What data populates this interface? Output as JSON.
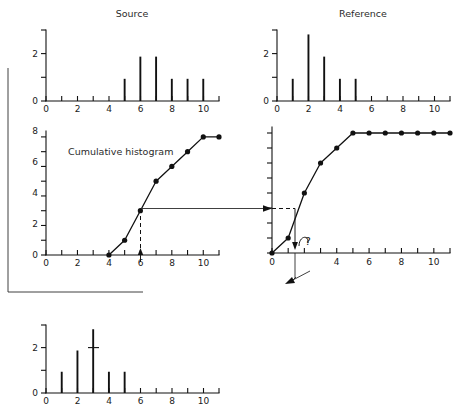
{
  "figure": {
    "background": "#ffffff",
    "ink_color": "#111111",
    "caption_color": "#2b2b2b"
  },
  "panels": {
    "source": {
      "title": "Source",
      "x_ticks": [
        "0",
        "2",
        "4",
        "6",
        "8",
        "10"
      ],
      "y_ticks": [
        "0",
        "2"
      ]
    },
    "reference": {
      "title": "Reference",
      "x_ticks": [
        "0",
        "2",
        "4",
        "6",
        "8",
        "10"
      ],
      "y_ticks": [
        "0",
        "2"
      ]
    },
    "cumulative_source": {
      "title": "Cumulative histogram",
      "x_ticks": [
        "0",
        "2",
        "4",
        "6",
        "8",
        "10"
      ],
      "y_ticks": [
        "0",
        "2",
        "4",
        "6",
        "8"
      ]
    },
    "cumulative_reference": {
      "title": "",
      "x_ticks": [
        "0",
        "4",
        "6",
        "8",
        "10"
      ],
      "y_ticks": []
    },
    "result": {
      "title": "",
      "x_ticks": [
        "0",
        "2",
        "4",
        "6",
        "8",
        "10"
      ],
      "y_ticks": [
        "0",
        "2"
      ]
    }
  },
  "annotations": {
    "question_mark": "?",
    "lookup_value_label": "3",
    "mapped_value_label": "1"
  },
  "chart_data": [
    {
      "id": "source-histogram",
      "type": "bar",
      "title": "Source",
      "xlabel": "",
      "ylabel": "",
      "categories": [
        0,
        1,
        2,
        3,
        4,
        5,
        6,
        7,
        8,
        9,
        10,
        11
      ],
      "values": [
        0,
        0,
        0,
        0,
        0,
        1,
        2,
        2,
        1,
        1,
        1,
        0
      ],
      "xlim": [
        0,
        11
      ],
      "ylim": [
        0,
        3.2
      ],
      "xticks": [
        0,
        1,
        2,
        3,
        4,
        5,
        6,
        7,
        8,
        9,
        10,
        11
      ],
      "xticklabels": {
        "0": "0",
        "2": "2",
        "4": "4",
        "6": "6",
        "8": "8",
        "10": "10"
      },
      "yticks": [
        0,
        1,
        2,
        3
      ],
      "yticklabels": {
        "0": "0",
        "2": "2"
      },
      "grid": false,
      "legend": null
    },
    {
      "id": "reference-histogram",
      "type": "bar",
      "title": "Reference",
      "xlabel": "",
      "ylabel": "",
      "categories": [
        0,
        1,
        2,
        3,
        4,
        5,
        6,
        7,
        8,
        9,
        10,
        11
      ],
      "values": [
        0,
        1,
        3,
        2,
        1,
        1,
        0,
        0,
        0,
        0,
        0,
        0
      ],
      "xlim": [
        0,
        11
      ],
      "ylim": [
        0,
        3.2
      ],
      "xticks": [
        0,
        1,
        2,
        3,
        4,
        5,
        6,
        7,
        8,
        9,
        10,
        11
      ],
      "xticklabels": {
        "0": "0",
        "2": "2",
        "4": "4",
        "6": "6",
        "8": "8",
        "10": "10"
      },
      "yticks": [
        0,
        1,
        2,
        3
      ],
      "yticklabels": {
        "0": "0",
        "2": "2"
      },
      "grid": false,
      "legend": null
    },
    {
      "id": "cumulative-source",
      "type": "line",
      "title": "Cumulative histogram",
      "xlabel": "",
      "ylabel": "",
      "x": [
        4,
        5,
        6,
        7,
        8,
        9,
        10,
        11
      ],
      "y": [
        0,
        1,
        3,
        5,
        6,
        7,
        8,
        8
      ],
      "markers": true,
      "xlim": [
        0,
        11
      ],
      "ylim": [
        0,
        8.4
      ],
      "xticks": [
        0,
        1,
        2,
        3,
        4,
        5,
        6,
        7,
        8,
        9,
        10,
        11
      ],
      "xticklabels": {
        "0": "0",
        "2": "2",
        "4": "4",
        "6": "6",
        "8": "8",
        "10": "10"
      },
      "yticks": [
        0,
        1,
        2,
        3,
        4,
        5,
        6,
        7,
        8
      ],
      "yticklabels": {
        "0": "0",
        "2": "2",
        "4": "4",
        "6": "6",
        "8": "8"
      },
      "grid": false,
      "legend": null,
      "annotations": [
        {
          "kind": "dashed-vertical",
          "x": 6,
          "y_from": 0,
          "y_to": 3
        },
        {
          "kind": "arrow-up",
          "x": 6,
          "y": 0
        }
      ]
    },
    {
      "id": "cumulative-reference",
      "type": "line",
      "title": "",
      "xlabel": "",
      "ylabel": "",
      "x": [
        0,
        1,
        2,
        3,
        4,
        5,
        6,
        7,
        8,
        9,
        10,
        11
      ],
      "y": [
        0,
        1,
        4,
        6,
        7,
        8,
        8,
        8,
        8,
        8,
        8,
        8
      ],
      "markers": true,
      "xlim": [
        0,
        11
      ],
      "ylim": [
        0,
        8.4
      ],
      "xticks": [
        0,
        1,
        2,
        3,
        4,
        5,
        6,
        7,
        8,
        9,
        10,
        11
      ],
      "xticklabels": {
        "0": "0",
        "4": "4",
        "6": "6",
        "8": "8",
        "10": "10"
      },
      "yticks": [
        0,
        1,
        2,
        3,
        4,
        5,
        6,
        7,
        8
      ],
      "yticklabels": {},
      "grid": false,
      "legend": null,
      "annotations": [
        {
          "kind": "dashed-horizontal",
          "y": 3,
          "x_from": 0,
          "x_to": 1.45
        },
        {
          "kind": "arrow-down",
          "x": 1.45,
          "y_from": 3,
          "y_to": 0
        },
        {
          "kind": "question",
          "text": "?",
          "x": 1.9,
          "y": 0.9
        }
      ]
    },
    {
      "id": "result-histogram",
      "type": "bar",
      "title": "",
      "xlabel": "",
      "ylabel": "",
      "categories": [
        0,
        1,
        2,
        3,
        4,
        5,
        6,
        7,
        8,
        9,
        10,
        11
      ],
      "values": [
        0,
        1,
        2,
        3,
        1,
        1,
        0,
        0,
        0,
        0,
        0,
        0
      ],
      "xlim": [
        0,
        11
      ],
      "ylim": [
        0,
        3.2
      ],
      "xticks": [
        0,
        1,
        2,
        3,
        4,
        5,
        6,
        7,
        8,
        9,
        10,
        11
      ],
      "xticklabels": {
        "0": "0",
        "2": "2",
        "4": "4",
        "6": "6",
        "8": "8",
        "10": "10"
      },
      "yticks": [
        0,
        1,
        2,
        3
      ],
      "yticklabels": {
        "0": "0",
        "2": "2"
      },
      "grid": false,
      "legend": null
    }
  ],
  "flow": {
    "description": "source cumulative value maps through reference cumulative back to result histogram",
    "arrows": [
      {
        "from": "cumulative-source",
        "to": "cumulative-reference",
        "direction": "right"
      },
      {
        "from": "cumulative-reference",
        "to": "result-histogram",
        "direction": "down-left"
      },
      {
        "from": "result-histogram",
        "to": "cumulative-source",
        "direction": "up-left"
      }
    ]
  }
}
